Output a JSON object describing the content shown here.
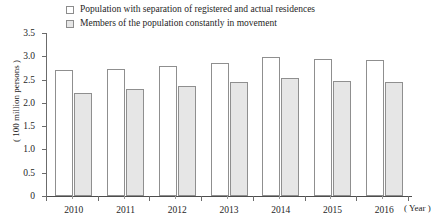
{
  "chart_data": {
    "type": "bar",
    "title": "",
    "xlabel": "( Year )",
    "ylabel": "( 100 million persons )",
    "categories": [
      "2010",
      "2011",
      "2012",
      "2013",
      "2014",
      "2015",
      "2016"
    ],
    "ylim": [
      0,
      3.5
    ],
    "ytick_labels": [
      "0",
      "0.5",
      "1.0",
      "1.5",
      "2.0",
      "2.5",
      "3.0",
      "3.5"
    ],
    "ytick_values": [
      0,
      0.5,
      1.0,
      1.5,
      2.0,
      2.5,
      3.0,
      3.5
    ],
    "grid": false,
    "legend_position": "top-left",
    "series": [
      {
        "name": "Population with separation of registered and actual residences",
        "color": "#ffffff",
        "border_color": "#8f8f8f",
        "values": [
          2.71,
          2.72,
          2.79,
          2.85,
          2.98,
          2.94,
          2.92
        ]
      },
      {
        "name": "Members of the population constantly in movement",
        "color": "#e6e6e6",
        "border_color": "#8f8f8f",
        "values": [
          2.21,
          2.3,
          2.36,
          2.45,
          2.53,
          2.47,
          2.45
        ]
      }
    ]
  },
  "legend": {
    "items": [
      {
        "label": "Population with separation of registered and actual residences",
        "swatch": "white"
      },
      {
        "label": "Members of the population constantly in movement",
        "swatch": "gray"
      }
    ]
  },
  "axes": {
    "y_title": "( 100 million persons )",
    "x_title": "( Year )"
  }
}
